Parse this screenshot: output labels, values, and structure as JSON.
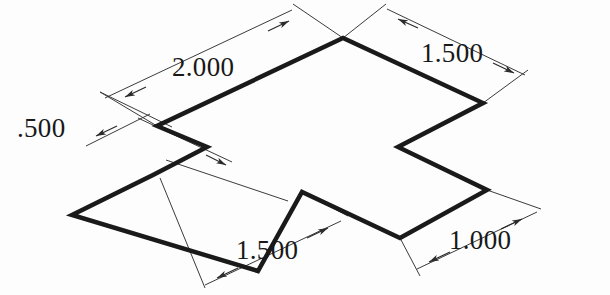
{
  "drawing": {
    "title": "Isometric cross-shaped plate dimensioned drawing",
    "background_color": "#fdfdfd",
    "object_line_color": "#1a1a1a",
    "dimension_line_color": "#3b3b3b",
    "text_color": "#191919",
    "object_outline_points": "343,38 157,126 207,147 153,175 72,215 258,271 302,192 400,238 487,190 398,147 483,103",
    "object_outline_closed": true,
    "dimensions": [
      {
        "id": "dim-2000-top-left",
        "label": "2.000",
        "value": "2.000",
        "text_x": 176,
        "text_y": 76,
        "line": {
          "x1": 105,
          "y1": 98,
          "x2": 292,
          "y2": 10
        },
        "ext1": {
          "x1": 157,
          "y1": 126,
          "x2": 100,
          "y2": 92
        },
        "ext2": {
          "x1": 343,
          "y1": 38,
          "x2": 293,
          "y2": 4
        },
        "arrow1_x": 128,
        "arrow1_y": 97,
        "arrow2_x": 286,
        "arrow2_y": 22
      },
      {
        "id": "dim-1500-top-right",
        "label": "1.500",
        "value": "1.500",
        "text_x": 423,
        "text_y": 62,
        "line": {
          "x1": 387,
          "y1": 9,
          "x2": 525,
          "y2": 75
        },
        "ext1": {
          "x1": 343,
          "y1": 38,
          "x2": 386,
          "y2": 4
        },
        "ext2": {
          "x1": 483,
          "y1": 103,
          "x2": 528,
          "y2": 70
        },
        "arrow1_x": 399,
        "arrow1_y": 19,
        "arrow2_x": 513,
        "arrow2_y": 72
      },
      {
        "id": "dim-500-left",
        "label": ".500",
        "value": ".500",
        "text_x": 18,
        "text_y": 136,
        "line": {
          "x1": 86,
          "y1": 144,
          "x2": 138,
          "y2": 118
        },
        "ext1": {
          "x1": 157,
          "y1": 126,
          "x2": 135,
          "y2": 113
        },
        "ext2": {
          "x1": 207,
          "y1": 147,
          "x2": 85,
          "y2": 150
        },
        "arrow1_x": 96,
        "arrow1_y": 136,
        "arrow2_x": 130,
        "arrow2_y": 122
      },
      {
        "id": "dim-1500-bottom",
        "label": "1.500",
        "value": "1.500",
        "text_x": 236,
        "text_y": 258,
        "line": {
          "x1": 205,
          "y1": 285,
          "x2": 340,
          "y2": 222
        },
        "ext1": {
          "x1": 153,
          "y1": 175,
          "x2": 196,
          "y2": 287
        },
        "ext2": {
          "x1": 302,
          "y1": 192,
          "x2": 345,
          "y2": 218
        },
        "arrow1_x": 217,
        "arrow1_y": 279,
        "arrow2_x": 328,
        "arrow2_y": 227
      },
      {
        "id": "dim-1000-bottom-right",
        "label": "1.000",
        "value": "1.000",
        "text_x": 450,
        "text_y": 248,
        "line": {
          "x1": 417,
          "y1": 268,
          "x2": 535,
          "y2": 213
        },
        "ext1": {
          "x1": 400,
          "y1": 238,
          "x2": 420,
          "y2": 275
        },
        "ext2": {
          "x1": 487,
          "y1": 190,
          "x2": 540,
          "y2": 209
        },
        "arrow1_x": 429,
        "arrow1_y": 262,
        "arrow2_x": 522,
        "arrow2_y": 219
      },
      {
        "id": "dim-leader-mid-left",
        "label": "",
        "value": "",
        "text_x": 0,
        "text_y": 0,
        "line": {
          "x1": 166,
          "y1": 160,
          "x2": 286,
          "y2": 200
        },
        "ext1": {
          "x1": 0,
          "y1": 0,
          "x2": 0,
          "y2": 0
        },
        "ext2": {
          "x1": 0,
          "y1": 0,
          "x2": 0,
          "y2": 0
        },
        "arrow1_x": 0,
        "arrow1_y": 0,
        "arrow2_x": 0,
        "arrow2_y": 0
      }
    ],
    "extra_construction_lines": [
      {
        "id": "cl-left-cross-a",
        "x1": 138,
        "y1": 118,
        "x2": 232,
        "y2": 162
      },
      {
        "id": "cl-left-cross-b",
        "x1": 100,
        "y1": 92,
        "x2": 172,
        "y2": 127
      },
      {
        "id": "cl-mid-notch-leader",
        "x1": 215,
        "y1": 158,
        "x2": 285,
        "y2": 196
      },
      {
        "id": "cl-bottom-right-leader",
        "x1": 305,
        "y1": 194,
        "x2": 358,
        "y2": 220
      }
    ]
  }
}
